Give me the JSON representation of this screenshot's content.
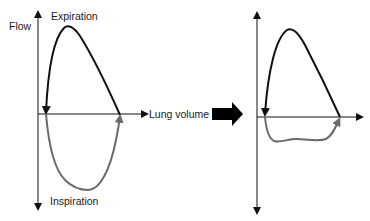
{
  "left_panel": {
    "y_axis_label": "Flow",
    "x_axis_label": "Lung volume",
    "top_label": "Expiration",
    "bottom_label": "Inspiration",
    "expiration_color": "#111111",
    "inspiration_color": "#6a6a6a"
  },
  "transition_arrow": {
    "icon": "right-block-arrow",
    "color": "#000000"
  },
  "right_panel": {
    "description": "Flow-volume loop with reduced (flattened) inspiratory limb",
    "expiration_color": "#111111",
    "inspiration_color": "#6a6a6a"
  }
}
